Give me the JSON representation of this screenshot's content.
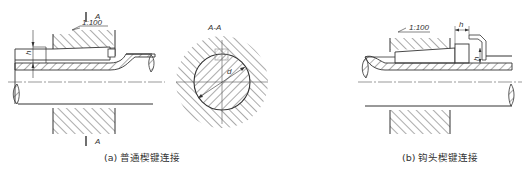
{
  "figure": {
    "panel_a": {
      "caption": "(a) 普通楔键连接",
      "section_mark_top": "A",
      "section_mark_bottom": "A",
      "taper_label": "1:100",
      "dimension_h": "h"
    },
    "section_view": {
      "title": "A-A",
      "dimension_d": "d"
    },
    "panel_b": {
      "caption": "(b) 钩头楔键连接",
      "taper_label": "1:100",
      "dimension_h_top": "h",
      "dimension_h_side": "h"
    },
    "colors": {
      "line": "#333333",
      "hatch": "#444444",
      "key_fill": "#eeeeee",
      "background": "#ffffff"
    }
  }
}
